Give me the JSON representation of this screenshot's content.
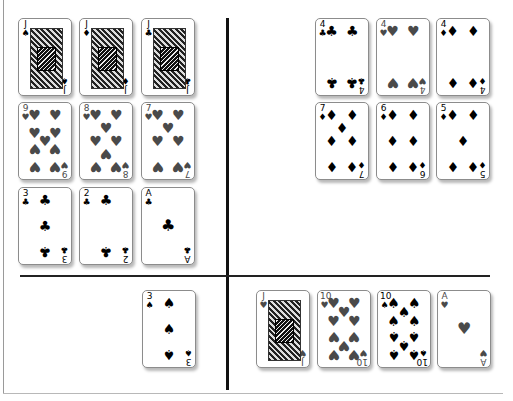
{
  "board": {
    "quadrants": {
      "top_left": [
        {
          "rank": "J",
          "suit": "spades",
          "symbol": "♠",
          "color": "black",
          "x": 18,
          "y": 18
        },
        {
          "rank": "J",
          "suit": "diamonds",
          "symbol": "♦",
          "color": "black",
          "x": 79,
          "y": 18
        },
        {
          "rank": "J",
          "suit": "clubs",
          "symbol": "♣",
          "color": "black",
          "x": 141,
          "y": 18
        },
        {
          "rank": "9",
          "suit": "hearts",
          "symbol": "♥",
          "color": "red",
          "x": 18,
          "y": 102
        },
        {
          "rank": "8",
          "suit": "hearts",
          "symbol": "♥",
          "color": "red",
          "x": 79,
          "y": 102
        },
        {
          "rank": "7",
          "suit": "hearts",
          "symbol": "♥",
          "color": "red",
          "x": 141,
          "y": 102
        },
        {
          "rank": "3",
          "suit": "clubs",
          "symbol": "♣",
          "color": "black",
          "x": 18,
          "y": 187
        },
        {
          "rank": "2",
          "suit": "clubs",
          "symbol": "♣",
          "color": "black",
          "x": 79,
          "y": 187
        },
        {
          "rank": "A",
          "suit": "clubs",
          "symbol": "♣",
          "color": "black",
          "x": 141,
          "y": 187
        }
      ],
      "top_right": [
        {
          "rank": "4",
          "suit": "clubs",
          "symbol": "♣",
          "color": "black",
          "x": 315,
          "y": 18
        },
        {
          "rank": "4",
          "suit": "hearts",
          "symbol": "♥",
          "color": "red",
          "x": 376,
          "y": 18
        },
        {
          "rank": "4",
          "suit": "diamonds",
          "symbol": "♦",
          "color": "black",
          "x": 436,
          "y": 18
        },
        {
          "rank": "7",
          "suit": "diamonds",
          "symbol": "♦",
          "color": "black",
          "x": 315,
          "y": 102
        },
        {
          "rank": "6",
          "suit": "diamonds",
          "symbol": "♦",
          "color": "black",
          "x": 376,
          "y": 102
        },
        {
          "rank": "5",
          "suit": "diamonds",
          "symbol": "♦",
          "color": "black",
          "x": 436,
          "y": 102
        }
      ],
      "bottom_left": [
        {
          "rank": "3",
          "suit": "spades",
          "symbol": "♠",
          "color": "black",
          "x": 142,
          "y": 290
        }
      ],
      "bottom_right": [
        {
          "rank": "J",
          "suit": "hearts",
          "symbol": "♥",
          "color": "red",
          "x": 256,
          "y": 290
        },
        {
          "rank": "10",
          "suit": "hearts",
          "symbol": "♥",
          "color": "red",
          "x": 317,
          "y": 290
        },
        {
          "rank": "10",
          "suit": "spades",
          "symbol": "♠",
          "color": "black",
          "x": 377,
          "y": 290
        },
        {
          "rank": "A",
          "suit": "hearts",
          "symbol": "♥",
          "color": "red",
          "x": 437,
          "y": 290
        }
      ]
    },
    "colors": {
      "red_suit": "#4a4a4a",
      "black_suit": "#000000",
      "divider": "#111111",
      "background": "#ffffff"
    }
  }
}
